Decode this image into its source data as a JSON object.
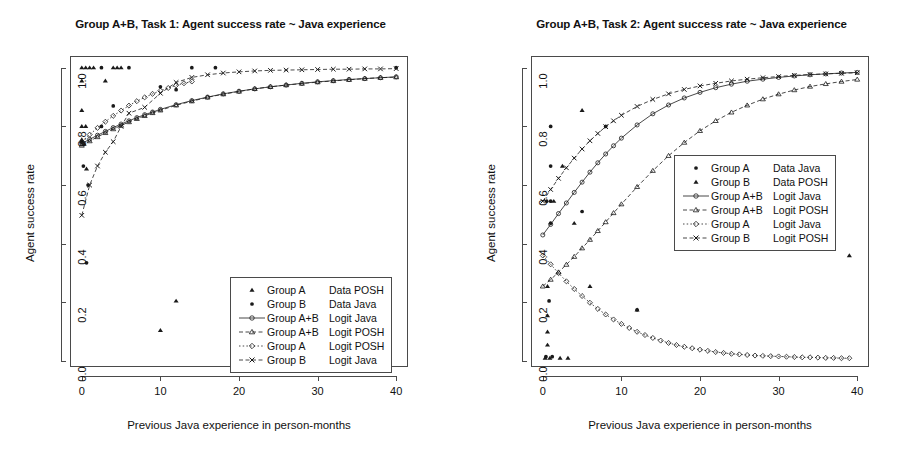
{
  "figure": {
    "width": 922,
    "height": 467,
    "background": "#ffffff",
    "ink": "#1a1a1a"
  },
  "chart_data": [
    {
      "type": "scatter",
      "panel": "left",
      "title": "Group A+B, Task 1: Agent success rate ~ Java experience",
      "xlabel": "Previous Java experience in person-months",
      "ylabel": "Agent success rate",
      "xlim": [
        -1.5,
        41.5
      ],
      "ylim": [
        -0.02,
        1.04
      ],
      "xticks": [
        0,
        10,
        20,
        30,
        40
      ],
      "xticklabels": [
        "0",
        "10",
        "20",
        "30",
        "40"
      ],
      "yticks": [
        0.0,
        0.2,
        0.4,
        0.6,
        0.8,
        1.0
      ],
      "yticklabels": [
        "0.0",
        "0.2",
        "0.4",
        "0.6",
        "0.8",
        "1.0"
      ],
      "grid": false,
      "legend_position": "bottom-right",
      "legend": [
        {
          "marker": "triangle-filled",
          "line": "none",
          "group": "Group A",
          "measure": "Data POSH"
        },
        {
          "marker": "circle-filled",
          "line": "none",
          "group": "Group B",
          "measure": "Data Java"
        },
        {
          "marker": "circle-open",
          "line": "solid",
          "group": "Group A+B",
          "measure": "Logit Java"
        },
        {
          "marker": "triangle-open",
          "line": "dashed",
          "group": "Group A+B",
          "measure": "Logit POSH"
        },
        {
          "marker": "diamond-open",
          "line": "dotted",
          "group": "Group A",
          "measure": "Logit POSH"
        },
        {
          "marker": "cross",
          "line": "dashed",
          "group": "Group B",
          "measure": "Logit Java"
        }
      ],
      "series": [
        {
          "name": "Group A Data POSH",
          "marker": "triangle-filled",
          "style": "points",
          "points": [
            [
              0,
              1.0
            ],
            [
              0.5,
              1.0
            ],
            [
              1,
              1.0
            ],
            [
              1.5,
              1.0
            ],
            [
              4,
              1.0
            ],
            [
              4.5,
              1.0
            ],
            [
              5,
              1.0
            ],
            [
              0,
              0.955
            ],
            [
              3,
              0.955
            ],
            [
              0,
              0.855
            ],
            [
              0,
              0.8
            ],
            [
              0.5,
              0.8
            ],
            [
              0,
              0.755
            ],
            [
              0.3,
              0.74
            ],
            [
              0.6,
              0.655
            ],
            [
              12,
              0.205
            ],
            [
              10,
              0.105
            ]
          ]
        },
        {
          "name": "Group B Data Java",
          "marker": "circle-filled",
          "style": "points",
          "points": [
            [
              2.5,
              1.0
            ],
            [
              6,
              1.0
            ],
            [
              14,
              1.0
            ],
            [
              17,
              1.0
            ],
            [
              40,
              1.0
            ],
            [
              10,
              0.935
            ],
            [
              12,
              0.925
            ],
            [
              4,
              0.87
            ],
            [
              2.5,
              0.8
            ],
            [
              0,
              0.745
            ],
            [
              0.2,
              0.665
            ],
            [
              0.8,
              0.6
            ],
            [
              0.6,
              0.335
            ]
          ]
        },
        {
          "name": "Group A+B Logit Java",
          "marker": "circle-open",
          "style": "line-points",
          "line": "solid",
          "x": [
            0,
            1,
            2,
            3,
            4,
            5,
            6,
            7,
            8,
            9,
            10,
            12,
            14,
            16,
            18,
            20,
            22,
            24,
            26,
            28,
            30,
            32,
            34,
            36,
            38,
            40
          ],
          "y": [
            0.742,
            0.756,
            0.77,
            0.783,
            0.796,
            0.808,
            0.819,
            0.83,
            0.84,
            0.849,
            0.858,
            0.874,
            0.888,
            0.9,
            0.911,
            0.92,
            0.928,
            0.935,
            0.941,
            0.947,
            0.952,
            0.956,
            0.96,
            0.963,
            0.966,
            0.969
          ]
        },
        {
          "name": "Group A+B Logit POSH",
          "marker": "triangle-open",
          "style": "line-points",
          "line": "dashed",
          "x": [
            0,
            1,
            2,
            3,
            4,
            5,
            6,
            7,
            8,
            9,
            10,
            12,
            14,
            16,
            18,
            20,
            22,
            24,
            26,
            28,
            30,
            32,
            34,
            36,
            38,
            40
          ],
          "y": [
            0.735,
            0.75,
            0.764,
            0.778,
            0.791,
            0.803,
            0.815,
            0.826,
            0.836,
            0.846,
            0.855,
            0.872,
            0.886,
            0.899,
            0.91,
            0.919,
            0.928,
            0.935,
            0.941,
            0.946,
            0.951,
            0.955,
            0.959,
            0.963,
            0.966,
            0.968
          ]
        },
        {
          "name": "Group A Logit POSH",
          "marker": "diamond-open",
          "style": "line-points",
          "line": "dotted",
          "x": [
            0,
            1,
            2,
            3,
            4,
            5,
            6,
            7,
            8,
            9,
            10,
            11,
            12,
            13,
            14
          ],
          "y": [
            0.748,
            0.772,
            0.795,
            0.816,
            0.836,
            0.854,
            0.871,
            0.886,
            0.899,
            0.911,
            0.922,
            0.931,
            0.94,
            0.947,
            0.953
          ]
        },
        {
          "name": "Group B Logit Java",
          "marker": "cross",
          "style": "line-points",
          "line": "dashed",
          "x": [
            0,
            1,
            2,
            3,
            4,
            5,
            6,
            8,
            10,
            12,
            14,
            16,
            18,
            20,
            22,
            24,
            26,
            28,
            30,
            32,
            34,
            36,
            38,
            40
          ],
          "y": [
            0.497,
            0.6,
            0.665,
            0.712,
            0.748,
            0.8,
            0.845,
            0.865,
            0.913,
            0.95,
            0.967,
            0.976,
            0.982,
            0.986,
            0.989,
            0.991,
            0.992,
            0.993,
            0.994,
            0.995,
            0.995,
            0.996,
            0.996,
            0.997
          ]
        }
      ]
    },
    {
      "type": "scatter",
      "panel": "right",
      "title": "Group A+B, Task 2: Agent success rate ~ Java experience",
      "xlabel": "Previous Java experience in person-months",
      "ylabel": "Agent success rate",
      "xlim": [
        -1.5,
        41.5
      ],
      "ylim": [
        -0.02,
        1.04
      ],
      "xticks": [
        0,
        10,
        20,
        30,
        40
      ],
      "xticklabels": [
        "0",
        "10",
        "20",
        "30",
        "40"
      ],
      "yticks": [
        0.0,
        0.2,
        0.4,
        0.6,
        0.8,
        1.0
      ],
      "yticklabels": [
        "0.0",
        "0.2",
        "0.4",
        "0.6",
        "0.8",
        "1.0"
      ],
      "grid": false,
      "legend_position": "center-right",
      "legend": [
        {
          "marker": "circle-filled",
          "line": "none",
          "group": "Group A",
          "measure": "Data Java"
        },
        {
          "marker": "triangle-filled",
          "line": "none",
          "group": "Group B",
          "measure": "Data POSH"
        },
        {
          "marker": "circle-open",
          "line": "solid",
          "group": "Group A+B",
          "measure": "Logit Java"
        },
        {
          "marker": "triangle-open",
          "line": "dashed",
          "group": "Group A+B",
          "measure": "Logit POSH"
        },
        {
          "marker": "diamond-open",
          "line": "dotted",
          "group": "Group A",
          "measure": "Logit Java"
        },
        {
          "marker": "cross",
          "line": "dashed",
          "group": "Group B",
          "measure": "Logit POSH"
        }
      ],
      "series": [
        {
          "name": "Group A Data Java",
          "marker": "circle-filled",
          "style": "points",
          "points": [
            [
              1,
              0.8
            ],
            [
              8,
              0.8
            ],
            [
              1,
              0.665
            ],
            [
              0.5,
              0.545
            ],
            [
              1,
              0.545
            ],
            [
              1,
              0.47
            ],
            [
              0.8,
              0.205
            ],
            [
              5,
              0.51
            ],
            [
              12,
              0.175
            ],
            [
              0.4,
              0.015
            ],
            [
              1.2,
              0.015
            ]
          ]
        },
        {
          "name": "Group B Data POSH",
          "marker": "triangle-filled",
          "style": "points",
          "points": [
            [
              5,
              0.855
            ],
            [
              39,
              0.36
            ],
            [
              2.5,
              0.665
            ],
            [
              1.4,
              0.545
            ],
            [
              4,
              0.47
            ],
            [
              0.6,
              0.255
            ],
            [
              6,
              0.255
            ],
            [
              0.6,
              0.155
            ],
            [
              0.6,
              0.1
            ],
            [
              0.6,
              0.055
            ],
            [
              0.3,
              0.01
            ],
            [
              0.9,
              0.01
            ],
            [
              2.2,
              0.01
            ],
            [
              3.2,
              0.01
            ],
            [
              12,
              0.175
            ]
          ]
        },
        {
          "name": "Group A+B Logit Java",
          "marker": "circle-open",
          "style": "line-points",
          "line": "solid",
          "x": [
            0,
            1,
            2,
            3,
            4,
            5,
            6,
            7,
            8,
            9,
            10,
            12,
            14,
            16,
            18,
            20,
            22,
            24,
            26,
            28,
            30,
            32,
            34,
            36,
            38,
            40
          ],
          "y": [
            0.43,
            0.466,
            0.503,
            0.539,
            0.575,
            0.61,
            0.644,
            0.676,
            0.706,
            0.734,
            0.76,
            0.805,
            0.843,
            0.873,
            0.897,
            0.916,
            0.932,
            0.944,
            0.954,
            0.961,
            0.967,
            0.972,
            0.976,
            0.979,
            0.982,
            0.984
          ]
        },
        {
          "name": "Group A+B Logit POSH",
          "marker": "triangle-open",
          "style": "line-points",
          "line": "dashed",
          "x": [
            0,
            1,
            2,
            3,
            4,
            5,
            6,
            7,
            8,
            9,
            10,
            12,
            14,
            16,
            18,
            20,
            22,
            24,
            26,
            28,
            30,
            32,
            34,
            36,
            38,
            40
          ],
          "y": [
            0.255,
            0.278,
            0.303,
            0.329,
            0.356,
            0.385,
            0.414,
            0.444,
            0.474,
            0.505,
            0.535,
            0.594,
            0.649,
            0.7,
            0.745,
            0.785,
            0.819,
            0.848,
            0.872,
            0.893,
            0.91,
            0.924,
            0.936,
            0.945,
            0.953,
            0.96
          ]
        },
        {
          "name": "Group A Logit Java",
          "marker": "diamond-open",
          "style": "line-points",
          "line": "dotted",
          "x": [
            0,
            1,
            2,
            3,
            4,
            5,
            6,
            7,
            8,
            9,
            10,
            11,
            12,
            13,
            14,
            15,
            16,
            17,
            18,
            19,
            20,
            21,
            22,
            23,
            24,
            25,
            26,
            27,
            28,
            29,
            30,
            31,
            32,
            33,
            34,
            35,
            36,
            37,
            38,
            39
          ],
          "y": [
            0.36,
            0.33,
            0.3,
            0.272,
            0.246,
            0.222,
            0.199,
            0.178,
            0.159,
            0.142,
            0.127,
            0.113,
            0.1,
            0.089,
            0.079,
            0.07,
            0.062,
            0.055,
            0.049,
            0.044,
            0.039,
            0.035,
            0.031,
            0.028,
            0.025,
            0.023,
            0.021,
            0.019,
            0.018,
            0.017,
            0.016,
            0.015,
            0.014,
            0.013,
            0.013,
            0.012,
            0.011,
            0.011,
            0.01,
            0.01
          ]
        },
        {
          "name": "Group B Logit POSH",
          "marker": "cross",
          "style": "line-points",
          "line": "dashed",
          "x": [
            0,
            1,
            2,
            3,
            4,
            5,
            6,
            7,
            8,
            9,
            10,
            12,
            14,
            16,
            18,
            20,
            22,
            24,
            26,
            28,
            30,
            32,
            34,
            36,
            38,
            40
          ],
          "y": [
            0.545,
            0.585,
            0.623,
            0.659,
            0.692,
            0.723,
            0.751,
            0.776,
            0.799,
            0.819,
            0.838,
            0.868,
            0.892,
            0.911,
            0.926,
            0.938,
            0.947,
            0.955,
            0.961,
            0.966,
            0.97,
            0.974,
            0.977,
            0.979,
            0.981,
            0.983
          ]
        }
      ]
    }
  ]
}
